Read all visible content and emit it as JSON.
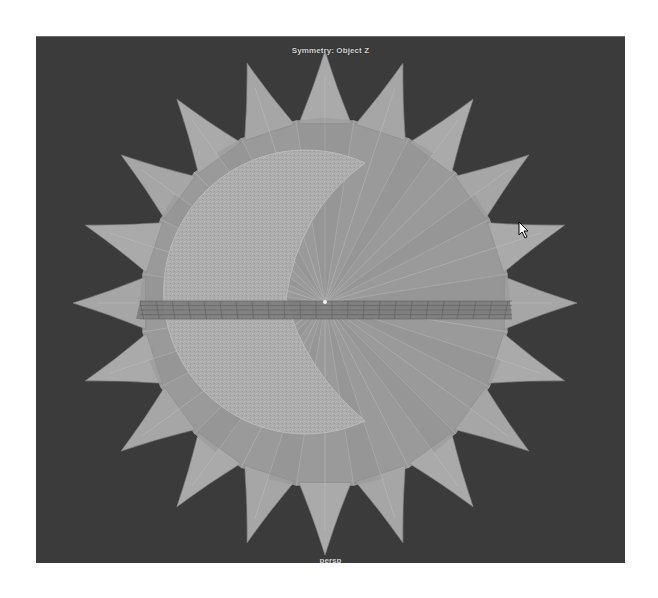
{
  "viewport": {
    "hud_top": "Symmetry: Object Z",
    "camera_label": "persp",
    "background_color": "#3b3b3b"
  },
  "scene": {
    "objects": [
      {
        "name": "star",
        "spikes": 20,
        "color": "#9c9c9c"
      },
      {
        "name": "crescent",
        "color": "#acacac"
      },
      {
        "name": "grid-plane",
        "color": "#6e6e6e"
      }
    ],
    "cursor_icon": "arrow-cursor-icon"
  }
}
